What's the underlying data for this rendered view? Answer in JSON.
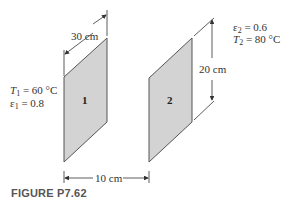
{
  "figure": {
    "caption": "FIGURE P7.62",
    "plates": [
      {
        "id": "plate-1",
        "label": "1",
        "temperature_symbol": "T",
        "temperature_sub": "1",
        "temperature_value": "= 60 °C",
        "emissivity_symbol": "ε",
        "emissivity_sub": "1",
        "emissivity_value": "= 0.8"
      },
      {
        "id": "plate-2",
        "label": "2",
        "temperature_symbol": "T",
        "temperature_sub": "2",
        "temperature_value": "= 80 °C",
        "emissivity_symbol": "ε",
        "emissivity_sub": "2",
        "emissivity_value": "= 0.6"
      }
    ],
    "dimensions": {
      "depth": "30 cm",
      "height": "20 cm",
      "spacing": "10 cm"
    },
    "colors": {
      "plate_fill": "#d3d3d3",
      "plate_stroke": "#555555",
      "line": "#333333"
    }
  }
}
